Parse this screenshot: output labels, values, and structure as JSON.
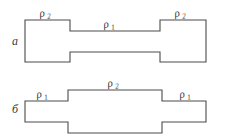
{
  "figure": {
    "caption_style": "russian-technical-diagram",
    "panels": [
      {
        "id": "a",
        "panel_label": "а",
        "shape": "dumbbell-wide-ends-narrow-middle",
        "region_labels": [
          {
            "symbol": "ρ",
            "subscript": "2",
            "position": "left-end"
          },
          {
            "symbol": "ρ",
            "subscript": "1",
            "position": "middle"
          },
          {
            "symbol": "ρ",
            "subscript": "2",
            "position": "right-end"
          }
        ],
        "outline_points": "25,20 70,20 70,31 160,31 160,20 206,20 206,62 160,62 160,52 70,52 70,62 25,62"
      },
      {
        "id": "b",
        "panel_label": "б",
        "shape": "inverse-dumbbell-narrow-ends-wide-middle",
        "region_labels": [
          {
            "symbol": "ρ",
            "subscript": "1",
            "position": "left-end"
          },
          {
            "symbol": "ρ",
            "subscript": "2",
            "position": "middle"
          },
          {
            "symbol": "ρ",
            "subscript": "1",
            "position": "right-end"
          }
        ],
        "outline_points": "25,101 68,101 68,90 162,90 162,101 206,101 206,122 162,122 162,133 68,133 68,122 25,122"
      }
    ],
    "label_positions": {
      "panel_a_label": {
        "x": 12,
        "y": 45
      },
      "panel_b_label": {
        "x": 12,
        "y": 113
      },
      "a_rho_left": {
        "x": 40,
        "y": 17
      },
      "a_rho_mid": {
        "x": 104,
        "y": 28
      },
      "a_rho_right": {
        "x": 175,
        "y": 17
      },
      "b_rho_left": {
        "x": 37,
        "y": 98
      },
      "b_rho_mid": {
        "x": 108,
        "y": 87
      },
      "b_rho_right": {
        "x": 180,
        "y": 98
      }
    },
    "colors": {
      "stroke": "#4a4a4a",
      "fill": "#ffffff",
      "text": "#3a3a3a",
      "background": "#ffffff"
    }
  }
}
